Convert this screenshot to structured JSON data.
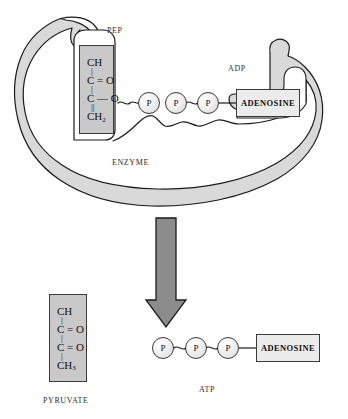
{
  "diagram": {
    "colors": {
      "enzyme_fill": "#d9d9d9",
      "enzyme_stroke": "#1a1a1a",
      "molecule_fill": "#c9c9c9",
      "molecule_stroke": "#3a3a3a",
      "adenosine_fill": "#ececec",
      "phosphate_fill": "#f2f2f2",
      "arrow_fill": "#8c8c8c",
      "arrow_stroke": "#1a1a1a",
      "text": "#1a1a1a",
      "background": "#ffffff"
    }
  },
  "top_panel": {
    "enzyme_label": "ENZYME",
    "pep_label": "PEP",
    "adp_label": "ADP",
    "pep_structure": {
      "name": "PEP",
      "rows": [
        {
          "type": "atom",
          "text": "CH"
        },
        {
          "type": "bond",
          "text": "|"
        },
        {
          "type": "atom",
          "text": "C = O"
        },
        {
          "type": "bond",
          "text": "|"
        },
        {
          "type": "atom",
          "text": "C — O"
        },
        {
          "type": "bond",
          "text": "||"
        },
        {
          "type": "atom",
          "text": "CH",
          "subscript": "2"
        }
      ]
    },
    "phosphates": [
      {
        "label": "P",
        "name": "pep-phosphate"
      },
      {
        "label": "P",
        "name": "adp-beta-phosphate"
      },
      {
        "label": "P",
        "name": "adp-alpha-phosphate"
      }
    ],
    "adenosine_label": "ADENOSINE"
  },
  "arrow": {
    "name": "reaction-arrow",
    "direction": "down"
  },
  "bottom_panel": {
    "pyruvate_label": "PYRUVATE",
    "atp_label": "ATP",
    "pyruvate_structure": {
      "name": "PYRUVATE",
      "rows": [
        {
          "type": "atom",
          "text": "CH"
        },
        {
          "type": "bond",
          "text": "|"
        },
        {
          "type": "atom",
          "text": "C = O"
        },
        {
          "type": "bond",
          "text": "|"
        },
        {
          "type": "atom",
          "text": "C = O"
        },
        {
          "type": "bond",
          "text": "|"
        },
        {
          "type": "atom",
          "text": "CH",
          "subscript": "3"
        }
      ]
    },
    "phosphates": [
      {
        "label": "P",
        "name": "atp-gamma-phosphate"
      },
      {
        "label": "P",
        "name": "atp-beta-phosphate"
      },
      {
        "label": "P",
        "name": "atp-alpha-phosphate"
      }
    ],
    "adenosine_label": "ADENOSINE"
  }
}
